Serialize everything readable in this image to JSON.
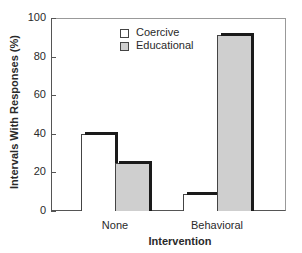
{
  "chart_data": {
    "type": "bar",
    "title": "",
    "xlabel": "Intervention",
    "ylabel": "Intervals With Responses (%)",
    "categories": [
      "None",
      "Behavioral"
    ],
    "series": [
      {
        "name": "Coercive",
        "values": [
          40,
          9
        ],
        "color": "#ffffff"
      },
      {
        "name": "Educational",
        "values": [
          25,
          91
        ],
        "color": "#cfcfcf"
      }
    ],
    "ylim": [
      0,
      100
    ],
    "yticks": [
      "0",
      "20",
      "40",
      "60",
      "80",
      "100"
    ],
    "grid": false,
    "legend_position": "upper-center"
  }
}
